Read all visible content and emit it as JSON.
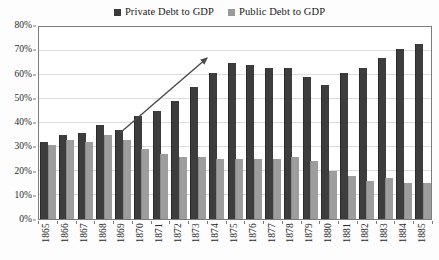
{
  "chart_data": {
    "type": "bar",
    "title": "",
    "subtitle": "",
    "xlabel": "",
    "ylabel": "",
    "ylim": [
      0,
      80
    ],
    "ytick_values": [
      0,
      10,
      20,
      30,
      40,
      50,
      60,
      70,
      80
    ],
    "ytick_labels": [
      "0%",
      "10%",
      "20%",
      "30%",
      "40%",
      "50%",
      "60%",
      "70%",
      "80%"
    ],
    "grid": true,
    "legend_position": "top-center",
    "categories": [
      "1865",
      "1866",
      "1867",
      "1868",
      "1869",
      "1870",
      "1871",
      "1872",
      "1873",
      "1874",
      "1875",
      "1876",
      "1877",
      "1878",
      "1879",
      "1880",
      "1881",
      "1882",
      "1883",
      "1884",
      "1885"
    ],
    "series": [
      {
        "name": "Private Debt to GDP",
        "color": "#3d3d3d",
        "values": [
          32,
          35,
          36,
          39,
          37,
          43,
          45,
          49,
          55,
          61,
          65,
          64,
          63,
          63,
          59,
          56,
          61,
          63,
          67,
          71,
          73
        ]
      },
      {
        "name": "Public Debt to GDP",
        "color": "#9d9d9d",
        "values": [
          31,
          33,
          32,
          35,
          33,
          29,
          27,
          26,
          26,
          25,
          25,
          25,
          25,
          26,
          24,
          20,
          18,
          16,
          17,
          15,
          15
        ]
      }
    ],
    "annotations": [
      {
        "type": "arrow",
        "label": "rising-trend-arrow",
        "x_start_pct": 20.8,
        "y_start_pct": 55.2,
        "x_end_pct": 42.9,
        "y_end_pct": 16.5,
        "color": "#4a4a4a"
      }
    ]
  },
  "legend": {
    "entries": [
      {
        "label": "Private Debt to GDP",
        "swatch": "swatch-private",
        "icon": "legend-square-icon"
      },
      {
        "label": "Public Debt to GDP",
        "swatch": "swatch-public",
        "icon": "legend-square-icon"
      }
    ]
  }
}
